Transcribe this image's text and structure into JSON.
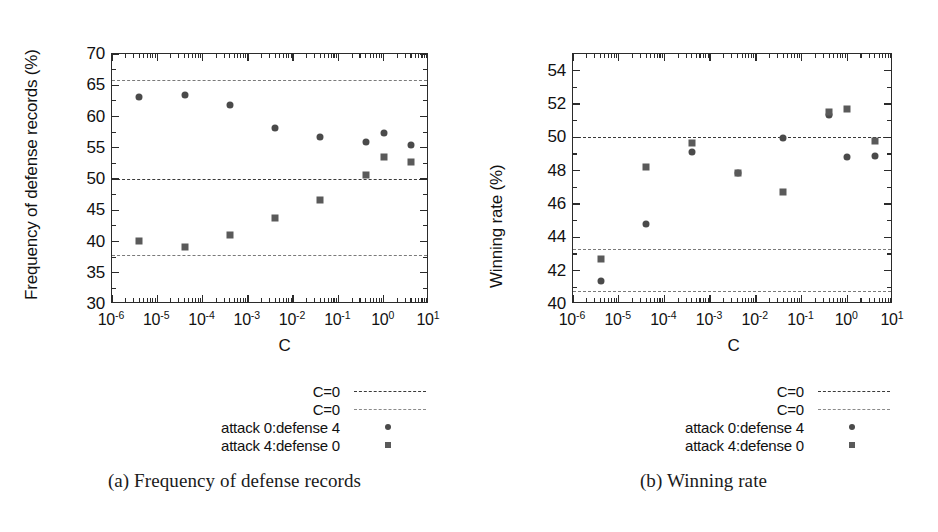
{
  "figure": {
    "panels": [
      {
        "id": "a",
        "subcaption": "(a) Frequency of defense records",
        "xtitle": "C",
        "ytitle": "Frequency of defense records (%)"
      },
      {
        "id": "b",
        "subcaption": "(b) Winning rate",
        "xtitle": "C",
        "ytitle": "Winning rate (%)"
      }
    ],
    "legend": {
      "rows": [
        {
          "label": "C=0",
          "key": "dashed-line-dark"
        },
        {
          "label": "C=0",
          "key": "dashed-line-light"
        },
        {
          "label": "attack 0:defense 4",
          "key": "circle-marker"
        },
        {
          "label": "attack 4:defense 0",
          "key": "square-marker"
        }
      ]
    },
    "colors": {
      "axis": "#2b2b2b",
      "circle_marker": "#4a4a4a",
      "square_marker": "#5a5a5a",
      "refline_dark": "#3a3a3a",
      "refline_light": "#7a7a7a",
      "background": "#ffffff"
    }
  },
  "chart_data": [
    {
      "type": "scatter",
      "panel": "a",
      "title": "(a) Frequency of defense records",
      "xlabel": "C",
      "ylabel": "Frequency of defense records (%)",
      "xscale": "log",
      "xlim": [
        1e-06,
        10
      ],
      "ylim": [
        30,
        70
      ],
      "yticks": [
        30,
        35,
        40,
        45,
        50,
        55,
        60,
        65,
        70
      ],
      "xticks": [
        1e-06,
        1e-05,
        0.0001,
        0.001,
        0.01,
        0.1,
        1,
        10
      ],
      "xticklabels": [
        "10-6",
        "10-5",
        "10-4",
        "10-3",
        "10-2",
        "10-1",
        "100",
        "101"
      ],
      "grid": false,
      "legend_position": "below",
      "reflines": [
        {
          "label": "C=0",
          "y": 65.8,
          "style": "dashed",
          "weight": "light"
        },
        {
          "label": "C=0",
          "y": 50.0,
          "style": "dashed",
          "weight": "dark"
        },
        {
          "label": "C=0",
          "y": 37.9,
          "style": "dashed",
          "weight": "light"
        }
      ],
      "series": [
        {
          "name": "attack 0:defense 4",
          "marker": "circle",
          "points": [
            {
              "x": 4e-06,
              "y": 63.2
            },
            {
              "x": 4e-05,
              "y": 63.5
            },
            {
              "x": 0.0004,
              "y": 61.8
            },
            {
              "x": 0.004,
              "y": 58.2
            },
            {
              "x": 0.04,
              "y": 56.7
            },
            {
              "x": 0.4,
              "y": 56.0
            },
            {
              "x": 1.0,
              "y": 57.4
            },
            {
              "x": 4.0,
              "y": 55.4
            }
          ]
        },
        {
          "name": "attack 4:defense 0",
          "marker": "square",
          "points": [
            {
              "x": 4e-06,
              "y": 40.1
            },
            {
              "x": 4e-05,
              "y": 39.1
            },
            {
              "x": 0.0004,
              "y": 41.1
            },
            {
              "x": 0.004,
              "y": 43.7
            },
            {
              "x": 0.04,
              "y": 46.6
            },
            {
              "x": 0.4,
              "y": 50.7
            },
            {
              "x": 1.0,
              "y": 53.6
            },
            {
              "x": 4.0,
              "y": 52.8
            }
          ]
        }
      ]
    },
    {
      "type": "scatter",
      "panel": "b",
      "title": "(b) Winning rate",
      "xlabel": "C",
      "ylabel": "Winning rate (%)",
      "xscale": "log",
      "xlim": [
        1e-06,
        10
      ],
      "ylim": [
        40,
        55
      ],
      "yticks": [
        40,
        42,
        44,
        46,
        48,
        50,
        52,
        54
      ],
      "xticks": [
        1e-06,
        1e-05,
        0.0001,
        0.001,
        0.01,
        0.1,
        1,
        10
      ],
      "xticklabels": [
        "10-6",
        "10-5",
        "10-4",
        "10-3",
        "10-2",
        "10-1",
        "100",
        "101"
      ],
      "grid": false,
      "legend_position": "below",
      "reflines": [
        {
          "label": "C=0",
          "y": 50.0,
          "style": "dashed",
          "weight": "dark"
        },
        {
          "label": "C=0",
          "y": 43.3,
          "style": "dashed",
          "weight": "light"
        },
        {
          "label": "C=0",
          "y": 40.8,
          "style": "dashed",
          "weight": "light"
        }
      ],
      "series": [
        {
          "name": "attack 0:defense 4",
          "marker": "circle",
          "points": [
            {
              "x": 4e-06,
              "y": 41.4
            },
            {
              "x": 4e-05,
              "y": 44.8
            },
            {
              "x": 0.0004,
              "y": 49.1
            },
            {
              "x": 0.004,
              "y": 47.85
            },
            {
              "x": 0.04,
              "y": 49.95
            },
            {
              "x": 0.4,
              "y": 51.35
            },
            {
              "x": 1.0,
              "y": 48.85
            },
            {
              "x": 4.0,
              "y": 48.9
            }
          ]
        },
        {
          "name": "attack 4:defense 0",
          "marker": "square",
          "points": [
            {
              "x": 4e-06,
              "y": 42.7
            },
            {
              "x": 4e-05,
              "y": 48.2
            },
            {
              "x": 0.0004,
              "y": 49.65
            },
            {
              "x": 0.004,
              "y": 47.85
            },
            {
              "x": 0.04,
              "y": 46.75
            },
            {
              "x": 0.4,
              "y": 51.5
            },
            {
              "x": 1.0,
              "y": 51.7
            },
            {
              "x": 4.0,
              "y": 49.8
            }
          ]
        }
      ]
    }
  ]
}
